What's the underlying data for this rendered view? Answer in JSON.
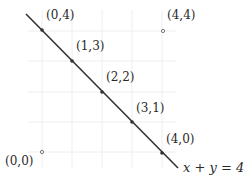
{
  "diagram": {
    "line_label": "x + y = 4",
    "line_color": "#333333",
    "grid_color": "#eeeeee",
    "points_on_line": [
      {
        "label": "(0,4)",
        "x": 0,
        "y": 4
      },
      {
        "label": "(1,3)",
        "x": 1,
        "y": 3
      },
      {
        "label": "(2,2)",
        "x": 2,
        "y": 2
      },
      {
        "label": "(3,1)",
        "x": 3,
        "y": 1
      },
      {
        "label": "(4,0)",
        "x": 4,
        "y": 0
      }
    ],
    "points_off_line": [
      {
        "label": "(4,4)",
        "x": 4,
        "y": 4
      },
      {
        "label": "(0,0)",
        "x": 0,
        "y": 0
      }
    ]
  }
}
